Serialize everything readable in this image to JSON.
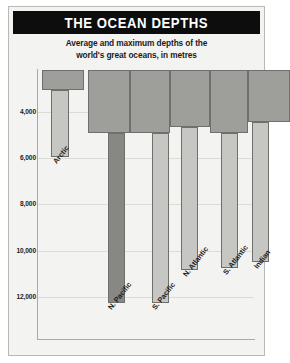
{
  "header": {
    "title": "THE OCEAN DEPTHS",
    "subtitle_line1": "Average and maximum depths of the",
    "subtitle_line2": "world's great oceans, in metres"
  },
  "colors": {
    "title_bar_background": "#0d0d0d",
    "title_text": "#ffffff",
    "card_background": "#f3f3f1",
    "card_border": "#b9b9b4",
    "average_bar": "#9e9e9b",
    "maximum_bar_light": "#c6c6c2",
    "maximum_bar_dark": "#878784",
    "bar_outline": "#6f6f6c",
    "gridline": "#dcdcd7",
    "axis": "#a9a9a4",
    "text": "#1b1b1b"
  },
  "chart_data": {
    "type": "bar",
    "title": "THE OCEAN DEPTHS",
    "subtitle": "Average and maximum depths of the world's great oceans, in metres",
    "xlabel": "",
    "ylabel": "",
    "units": "metres",
    "orientation": "downward",
    "grid": true,
    "legend": "none",
    "ylim": [
      0,
      12800
    ],
    "yticks": [
      4000,
      6000,
      8000,
      10000,
      12000
    ],
    "ytick_labels": [
      "4,000",
      "6,000",
      "8,000",
      "10,000",
      "12,000"
    ],
    "categories": [
      "Arctic",
      "N. Pacific",
      "S. Pacific",
      "N. Atlantic",
      "S. Atlantic",
      "Indian"
    ],
    "series": [
      {
        "name": "Average depth",
        "values": [
          3000,
          4900,
          4900,
          4600,
          4900,
          4400
        ]
      },
      {
        "name": "Maximum depth",
        "values": [
          5900,
          12250,
          12000,
          10800,
          10700,
          10400
        ]
      }
    ]
  },
  "axis": {
    "ticks": [
      {
        "label": "4,000",
        "value": 4000
      },
      {
        "label": "6,000",
        "value": 6000
      },
      {
        "label": "8,000",
        "value": 8000
      },
      {
        "label": "10,000",
        "value": 10000
      },
      {
        "label": "12,000",
        "value": 12000
      }
    ]
  },
  "bars": [
    {
      "name": "Arctic",
      "label": "Arctic",
      "avg_top": 70,
      "avg_bottom": 90,
      "max_bottom": 157,
      "max_shade": "light",
      "col_left": 4,
      "col_width": 42,
      "max_left": 9,
      "max_width": 18,
      "label_x": 13,
      "label_y": 160
    },
    {
      "name": "N. Pacific",
      "label": "N. Pacific",
      "avg_top": 70,
      "avg_bottom": 133,
      "max_bottom": 303,
      "max_shade": "dark",
      "col_left": 50,
      "col_width": 42,
      "max_left": 20,
      "max_width": 17,
      "label_x": 68,
      "label_y": 306
    },
    {
      "name": "S. Pacific",
      "label": "S. Pacific",
      "avg_top": 70,
      "avg_bottom": 133,
      "max_bottom": 303,
      "max_shade": "light",
      "col_left": 92,
      "col_width": 40,
      "max_left": 22,
      "max_width": 17,
      "label_x": 112,
      "label_y": 306
    },
    {
      "name": "N. Atlantic",
      "label": "N. Atlantic",
      "avg_top": 70,
      "avg_bottom": 127,
      "max_bottom": 270,
      "max_shade": "light",
      "col_left": 132,
      "col_width": 40,
      "max_left": 11,
      "max_width": 17,
      "label_x": 143,
      "label_y": 273
    },
    {
      "name": "S. Atlantic",
      "label": "S. Atlantic",
      "avg_top": 70,
      "avg_bottom": 133,
      "max_bottom": 268,
      "max_shade": "light",
      "col_left": 172,
      "col_width": 38,
      "max_left": 11,
      "max_width": 17,
      "label_x": 183,
      "label_y": 271
    },
    {
      "name": "Indian",
      "label": "Indian",
      "avg_top": 70,
      "avg_bottom": 122,
      "max_bottom": 262,
      "max_shade": "light",
      "col_left": 210,
      "col_width": 42,
      "max_left": 4,
      "max_width": 17,
      "label_x": 214,
      "label_y": 265
    }
  ]
}
